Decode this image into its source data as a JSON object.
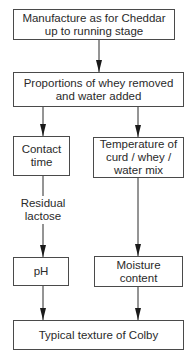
{
  "diagram": {
    "type": "flowchart",
    "nodes": {
      "start": {
        "label": "Manufacture as for Cheddar\nup to running stage"
      },
      "proportions": {
        "label": "Proportions of whey removed\nand water added"
      },
      "contact_time": {
        "label": "Contact\ntime"
      },
      "temperature": {
        "label": "Temperature of\ncurd / whey /\nwater mix"
      },
      "ph": {
        "label": "pH"
      },
      "moisture": {
        "label": "Moisture\ncontent"
      },
      "result": {
        "label": "Typical texture of Colby"
      }
    },
    "edge_labels": {
      "residual_lactose": "Residual\nlactose"
    },
    "edges": [
      {
        "from": "start",
        "to": "proportions"
      },
      {
        "from": "proportions",
        "to": "contact_time"
      },
      {
        "from": "proportions",
        "to": "temperature"
      },
      {
        "from": "contact_time",
        "to": "ph",
        "label": "Residual lactose"
      },
      {
        "from": "temperature",
        "to": "moisture"
      },
      {
        "from": "ph",
        "to": "result"
      },
      {
        "from": "moisture",
        "to": "result"
      }
    ],
    "colors": {
      "line": "#2a2a2a",
      "border": "#4a4a4a",
      "background": "#ffffff"
    }
  }
}
